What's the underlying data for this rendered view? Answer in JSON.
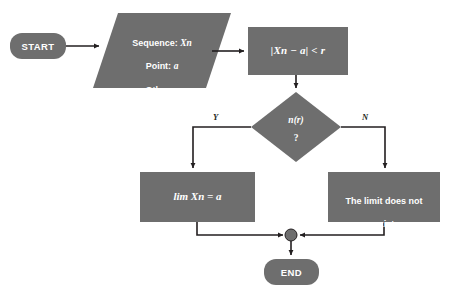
{
  "diagram": {
    "type": "flowchart",
    "colors": {
      "node_fill": "#6e6e6e",
      "node_text": "#ffffff",
      "connector": "#231f20",
      "background": "#ffffff",
      "branch_label_text": "#231f20"
    },
    "nodes": {
      "start": {
        "shape": "terminator",
        "label": "START"
      },
      "input": {
        "shape": "parallelogram",
        "line1_prefix": "Sequence: ",
        "line1_var": "Xn",
        "line2_prefix": "Point: ",
        "line2_var": "a",
        "line3_prefix": "Other: ",
        "line3_var": "r"
      },
      "process": {
        "shape": "rectangle",
        "label": "|Xn − a| < r"
      },
      "decision": {
        "shape": "diamond",
        "label": "n(r)",
        "question": "?"
      },
      "result_yes": {
        "shape": "rectangle",
        "label": "lim Xn = a"
      },
      "result_no": {
        "shape": "rectangle",
        "line1": "The limit does not",
        "line2": "exist"
      },
      "merge": {
        "shape": "connector-dot",
        "label": ""
      },
      "end": {
        "shape": "terminator",
        "label": "END"
      }
    },
    "branches": {
      "yes": "Y",
      "no": "N"
    }
  }
}
